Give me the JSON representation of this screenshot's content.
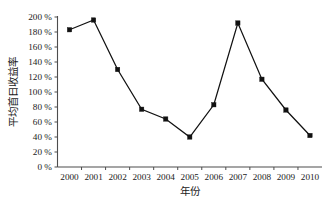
{
  "chart_data": {
    "type": "line",
    "title": "",
    "xlabel": "年份",
    "ylabel": "平均首日收益率",
    "categories": [
      "2000",
      "2001",
      "2002",
      "2003",
      "2004",
      "2005",
      "2006",
      "2007",
      "2008",
      "2009",
      "2010"
    ],
    "values": [
      183,
      196,
      130,
      77,
      64,
      40,
      83,
      192,
      117,
      76,
      42
    ],
    "series": [
      {
        "name": "平均首日收益率",
        "values": [
          183,
          196,
          130,
          77,
          64,
          40,
          83,
          192,
          117,
          76,
          42
        ]
      }
    ],
    "ylim": [
      0,
      200
    ],
    "ytick_values": [
      0,
      20,
      40,
      60,
      80,
      100,
      120,
      140,
      160,
      180,
      200
    ],
    "ytick_labels": [
      "0 %",
      "20 %",
      "40 %",
      "60 %",
      "80 %",
      "100 %",
      "120 %",
      "140 %",
      "160 %",
      "180 %",
      "200 %"
    ],
    "xtick_labels": [
      "2000",
      "2001",
      "2002",
      "2003",
      "2004",
      "2005",
      "2006",
      "2007",
      "2008",
      "2009",
      "2010"
    ],
    "grid": false,
    "legend": "none",
    "marker": "square",
    "line_color": "#111111",
    "marker_color": "#111111",
    "axis_color": "#4d4d4d",
    "background_color": "#ffffff"
  }
}
